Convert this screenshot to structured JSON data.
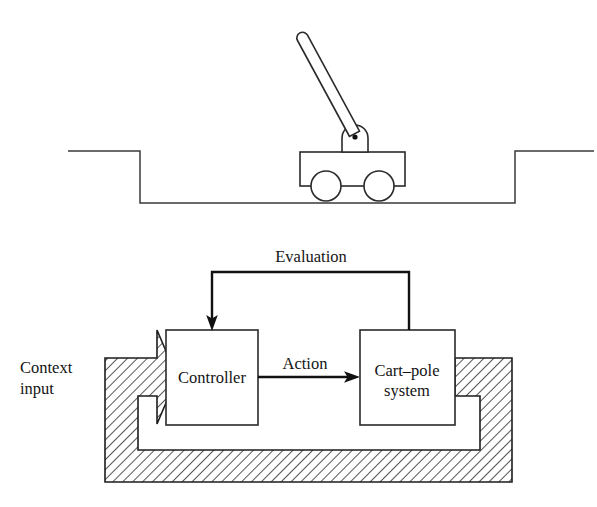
{
  "figure": {
    "caption": "",
    "top_panel": {
      "name": "cart-pole-illustration",
      "parts": {
        "track_label": "track",
        "cart_label": "cart",
        "pole_label": "pole",
        "pivot_label": "pivot",
        "wheel_label": "wheel"
      }
    },
    "bottom_panel": {
      "name": "control-block-diagram",
      "blocks": [
        {
          "id": "controller",
          "label": "Controller"
        },
        {
          "id": "cart-pole-system",
          "label": "Cart–pole\nsystem",
          "label_line1": "Cart–pole",
          "label_line2": "system"
        }
      ],
      "edges": [
        {
          "id": "evaluation",
          "label": "Evaluation",
          "from": "cart-pole-system",
          "to": "controller"
        },
        {
          "id": "action",
          "label": "Action",
          "from": "controller",
          "to": "cart-pole-system"
        },
        {
          "id": "context-feedback",
          "label": "",
          "from": "cart-pole-system",
          "to": "controller"
        }
      ],
      "context": {
        "id": "context-input",
        "label_line1": "Context",
        "label_line2": "input"
      }
    }
  },
  "colors": {
    "ink": "#141414",
    "line": "#2a2a2a",
    "flow": "#111111",
    "background": "#ffffff",
    "hatch": "#1d1d1d"
  }
}
